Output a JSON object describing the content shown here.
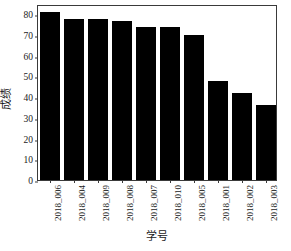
{
  "chart_data": {
    "type": "bar",
    "title": "",
    "subtitle": "",
    "xlabel": "学号",
    "ylabel": "成绩",
    "categories": [
      "2018_006",
      "2018_004",
      "2018_009",
      "2018_008",
      "2018_007",
      "2018_010",
      "2018_005",
      "2018_001",
      "2018_002",
      "2018_003"
    ],
    "values": [
      81,
      78,
      78,
      77,
      74,
      74,
      70,
      48,
      42,
      36
    ],
    "series": [
      {
        "name": "成绩",
        "values": [
          81,
          78,
          78,
          77,
          74,
          74,
          70,
          48,
          42,
          36
        ]
      }
    ],
    "ylim": [
      0,
      85
    ],
    "yticks": [
      0,
      10,
      20,
      30,
      40,
      50,
      60,
      70,
      80
    ],
    "ytick_labels": [
      "0",
      "10",
      "20",
      "30",
      "40",
      "50",
      "60",
      "70",
      "80"
    ],
    "grid": false,
    "legend": false,
    "legend_position": "none",
    "bar_color": "#000000",
    "axis_color": "#3a3a3a",
    "background_color": "#ffffff",
    "bar_width_ratio": 0.8,
    "xtick_label_rotation": 90
  }
}
